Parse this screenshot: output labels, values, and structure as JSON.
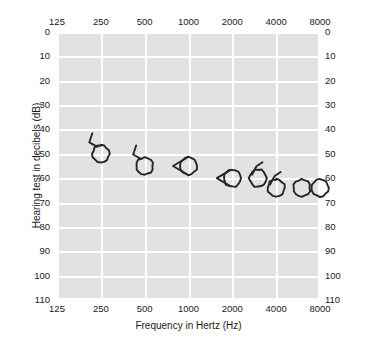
{
  "chart_data": {
    "type": "scatter",
    "title": "",
    "xlabel": "Frequency in Hertz (Hz)",
    "ylabel": "Hearing test in decibels (dB)",
    "x_scale": "log",
    "x_tick_labels": [
      "125",
      "250",
      "500",
      "1000",
      "2000",
      "4000",
      "8000"
    ],
    "x_tick_values": [
      125,
      250,
      500,
      1000,
      2000,
      4000,
      8000
    ],
    "xlim": [
      125,
      8000
    ],
    "y_tick_labels": [
      "0",
      "10",
      "20",
      "30",
      "40",
      "50",
      "60",
      "70",
      "80",
      "90",
      "100",
      "110"
    ],
    "y_tick_values": [
      0,
      10,
      20,
      30,
      40,
      50,
      60,
      70,
      80,
      90,
      100,
      110
    ],
    "ylim": [
      0,
      110
    ],
    "y_inverted": true,
    "grid": true,
    "legend": "none",
    "plot_background": "#e2e2e2",
    "gridline_color": "#ffffff",
    "marker_color": "#262626",
    "series": [
      {
        "name": "Right ear air conduction",
        "marker": "circle",
        "points": [
          {
            "frequency": 250,
            "decibels": 50,
            "masked": true
          },
          {
            "frequency": 500,
            "decibels": 55,
            "masked": true
          },
          {
            "frequency": 1000,
            "decibels": 55,
            "masked": true
          },
          {
            "frequency": 2000,
            "decibels": 60,
            "masked": true
          },
          {
            "frequency": 3000,
            "decibels": 60,
            "masked": true
          },
          {
            "frequency": 4000,
            "decibels": 64,
            "masked": true
          },
          {
            "frequency": 6000,
            "decibels": 64,
            "masked": false
          },
          {
            "frequency": 8000,
            "decibels": 64,
            "masked": false
          }
        ]
      }
    ]
  }
}
